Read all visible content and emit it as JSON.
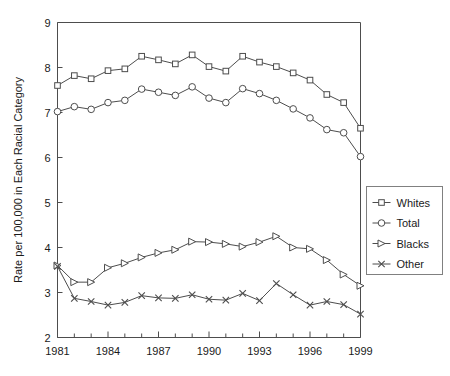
{
  "chart_data": {
    "type": "line",
    "title": "",
    "xlabel": "",
    "ylabel": "Rate per 100,000 in Each Racial Category",
    "x": [
      1981,
      1982,
      1983,
      1984,
      1985,
      1986,
      1987,
      1988,
      1989,
      1990,
      1991,
      1992,
      1993,
      1994,
      1995,
      1996,
      1997,
      1998,
      1999
    ],
    "xlim": [
      1981,
      1999
    ],
    "ylim": [
      2,
      9
    ],
    "xticks": [
      1981,
      1984,
      1987,
      1990,
      1993,
      1996,
      1999
    ],
    "xticklabels": [
      "1981",
      "1984",
      "1987",
      "1990",
      "1993",
      "1996",
      "1999"
    ],
    "yticks": [
      2,
      3,
      4,
      5,
      6,
      7,
      8,
      9
    ],
    "yticklabels": [
      "2",
      "3",
      "4",
      "5",
      "6",
      "7",
      "8",
      "9"
    ],
    "grid": false,
    "legend_position": "right",
    "series": [
      {
        "name": "Whites",
        "marker": "square",
        "values": [
          7.6,
          7.82,
          7.75,
          7.93,
          7.97,
          8.25,
          8.17,
          8.08,
          8.28,
          8.02,
          7.92,
          8.25,
          8.12,
          8.02,
          7.88,
          7.72,
          7.4,
          7.22,
          6.65
        ]
      },
      {
        "name": "Total",
        "marker": "circle",
        "values": [
          7.02,
          7.13,
          7.07,
          7.22,
          7.27,
          7.52,
          7.45,
          7.38,
          7.57,
          7.32,
          7.22,
          7.53,
          7.42,
          7.27,
          7.08,
          6.88,
          6.62,
          6.55,
          6.02
        ]
      },
      {
        "name": "Blacks",
        "marker": "triangle",
        "values": [
          3.6,
          3.23,
          3.23,
          3.55,
          3.65,
          3.78,
          3.88,
          3.95,
          4.13,
          4.12,
          4.08,
          4.02,
          4.12,
          4.25,
          4.0,
          3.97,
          3.72,
          3.4,
          3.15
        ]
      },
      {
        "name": "Other",
        "marker": "x",
        "values": [
          3.58,
          2.87,
          2.8,
          2.72,
          2.78,
          2.93,
          2.88,
          2.87,
          2.95,
          2.85,
          2.83,
          2.98,
          2.82,
          3.2,
          2.95,
          2.72,
          2.8,
          2.73,
          2.52
        ]
      }
    ]
  }
}
